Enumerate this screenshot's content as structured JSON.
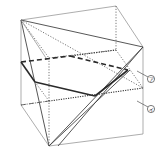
{
  "figure": {
    "type": "cube-cross-section",
    "labels": [
      {
        "id": "a",
        "text": "ア"
      },
      {
        "id": "i",
        "text": "イ"
      }
    ]
  }
}
